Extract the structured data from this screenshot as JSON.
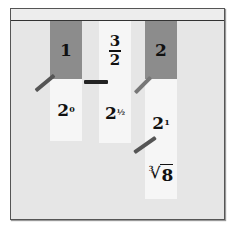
{
  "scene": {
    "description": "Cards hanging from a string with clothespins showing equivalent values",
    "colors": {
      "red_card": "#8c8c8c",
      "white_card": "#f6f6f6",
      "board": "#e6e6e6",
      "string": "#333333",
      "clothespin": "#555555"
    }
  },
  "cards": [
    {
      "top": "1",
      "bottom_base": "2",
      "bottom_exp": "0"
    },
    {
      "top_num": "3",
      "top_den": "2",
      "bottom_base": "2",
      "bottom_exp": "½"
    },
    {
      "top": "2",
      "bottom_base": "2",
      "bottom_exp": "1",
      "extra_index": "3",
      "extra_radical": "√",
      "extra_radicand": "8"
    }
  ]
}
